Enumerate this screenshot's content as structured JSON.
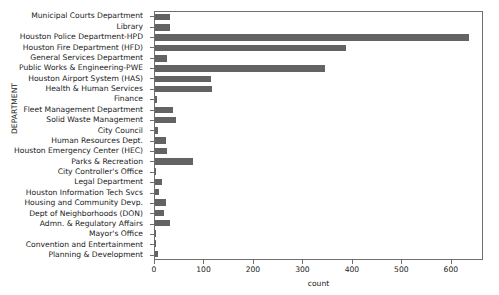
{
  "chart_data": {
    "type": "bar",
    "orientation": "horizontal",
    "title": "",
    "xlabel": "count",
    "ylabel": "DEPARTMENT",
    "xlim": [
      0,
      665
    ],
    "ylim": null,
    "grid": false,
    "legend": null,
    "bar_color": "#636363",
    "xticks": [
      0,
      100,
      200,
      300,
      400,
      500,
      600
    ],
    "categories": [
      "Municipal Courts Department",
      "Library",
      "Houston Police Department-HPD",
      "Houston Fire Department (HFD)",
      "General Services Department",
      "Public Works & Engineering-PWE",
      "Houston Airport System (HAS)",
      "Health & Human Services",
      "Finance",
      "Fleet Management Department",
      "Solid Waste Management",
      "City Council",
      "Human Resources Dept.",
      "Houston Emergency Center (HEC)",
      "Parks & Recreation",
      "City Controller's Office",
      "Legal Department",
      "Houston Information Tech Svcs",
      "Housing and Community Devp.",
      "Dept of Neighborhoods (DON)",
      "Admn. & Regulatory Affairs",
      "Mayor's Office",
      "Convention and Entertainment",
      "Planning & Development"
    ],
    "values": [
      30,
      31,
      634,
      386,
      24,
      343,
      113,
      115,
      5,
      36,
      43,
      6,
      22,
      24,
      77,
      3,
      14,
      8,
      23,
      18,
      31,
      2,
      1,
      6
    ]
  }
}
